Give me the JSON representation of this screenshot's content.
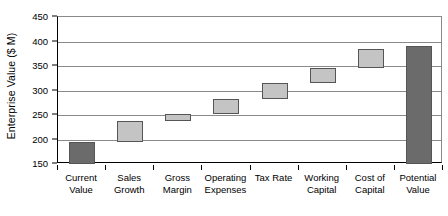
{
  "chart_data": {
    "type": "bar",
    "subtype": "waterfall",
    "title": "",
    "xlabel": "",
    "ylabel": "Enterprise Value ($ M)",
    "ylim": [
      150,
      450
    ],
    "yticks": [
      150,
      200,
      250,
      300,
      350,
      400,
      450
    ],
    "ytick_labels": [
      "150",
      "200",
      "250",
      "300",
      "350",
      "400",
      "450"
    ],
    "grid": true,
    "legend": "none",
    "categories": [
      "Current Value",
      "Sales Growth",
      "Gross Margin",
      "Operating Expenses",
      "Tax Rate",
      "Working Capital",
      "Cost of Capital",
      "Potential Value"
    ],
    "category_lines": [
      [
        "Current",
        "Value"
      ],
      [
        "Sales",
        "Growth"
      ],
      [
        "Gross",
        "Margin"
      ],
      [
        "Operating",
        "Expenses"
      ],
      [
        "Tax Rate",
        ""
      ],
      [
        "Working",
        "Capital"
      ],
      [
        "Cost of",
        "Capital"
      ],
      [
        "Potential",
        "Value"
      ]
    ],
    "bars": [
      {
        "label": "Current Value",
        "base": 150,
        "top": 195,
        "delta": 45,
        "kind": "total"
      },
      {
        "label": "Sales Growth",
        "base": 195,
        "top": 237,
        "delta": 42,
        "kind": "increase"
      },
      {
        "label": "Gross Margin",
        "base": 237,
        "top": 253,
        "delta": 16,
        "kind": "increase"
      },
      {
        "label": "Operating Expenses",
        "base": 253,
        "top": 283,
        "delta": 30,
        "kind": "increase"
      },
      {
        "label": "Tax Rate",
        "base": 283,
        "top": 315,
        "delta": 32,
        "kind": "increase"
      },
      {
        "label": "Working Capital",
        "base": 315,
        "top": 345,
        "delta": 30,
        "kind": "increase"
      },
      {
        "label": "Cost of Capital",
        "base": 345,
        "top": 385,
        "delta": 40,
        "kind": "increase"
      },
      {
        "label": "Potential Value",
        "base": 150,
        "top": 390,
        "delta": 240,
        "kind": "total"
      }
    ],
    "colors": {
      "total_bar": "#6b6b6b",
      "increase_bar": "#c4c4c4",
      "bar_border": "#555555",
      "gridline": "#8a8a8a",
      "axis": "#000000",
      "background": "#ffffff",
      "text": "#000000"
    }
  }
}
